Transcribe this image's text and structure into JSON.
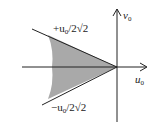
{
  "diagram": {
    "axes": {
      "horizontal_label": "u",
      "horizontal_sub": "0",
      "vertical_label": "v",
      "vertical_sub": "0"
    },
    "boundaries": {
      "upper_label_prefix": "+u",
      "upper_label_sub": "0",
      "upper_label_suffix": "/2√2",
      "lower_label_prefix": "−u",
      "lower_label_sub": "0",
      "lower_label_suffix": "/2√2"
    },
    "colors": {
      "shade": "#a9a9a9",
      "line": "#222222"
    }
  }
}
